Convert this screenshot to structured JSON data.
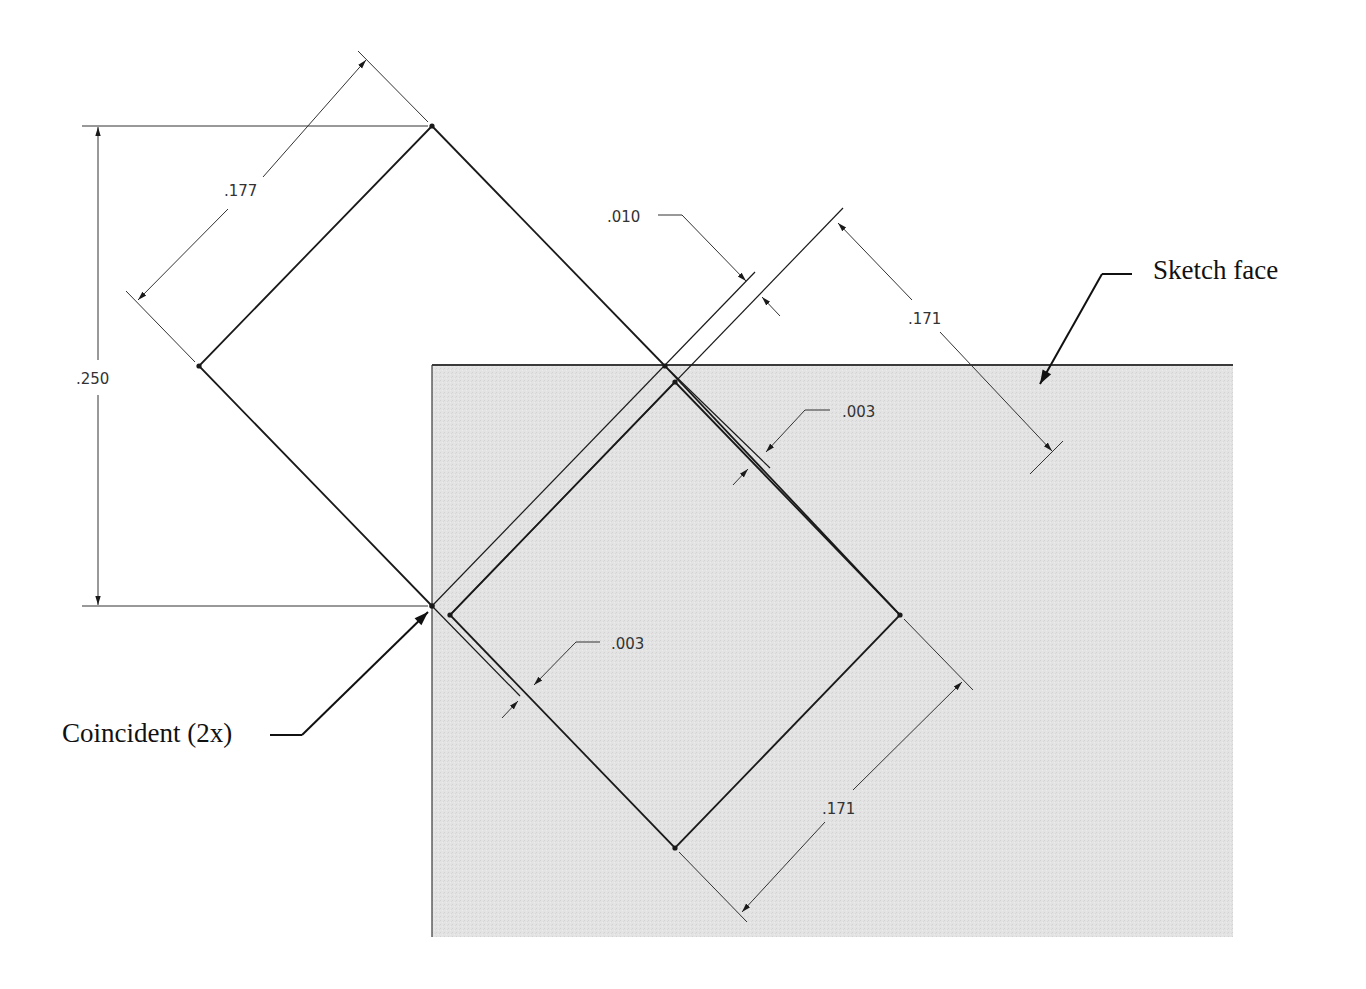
{
  "drawing": {
    "colors": {
      "background": "#ffffff",
      "sketch_face_fill": "#e4e4e4",
      "line": "#1a1a1a",
      "dim_line": "#333333"
    },
    "dimensions": {
      "height_250": ".250",
      "width_177": ".177",
      "offset_010": ".010",
      "side_171_top": ".171",
      "side_171_bottom": ".171",
      "gap_003_top": ".003",
      "gap_003_bottom": ".003"
    },
    "callouts": {
      "sketch_face": "Sketch face",
      "coincident": "Coincident (2x)"
    }
  }
}
